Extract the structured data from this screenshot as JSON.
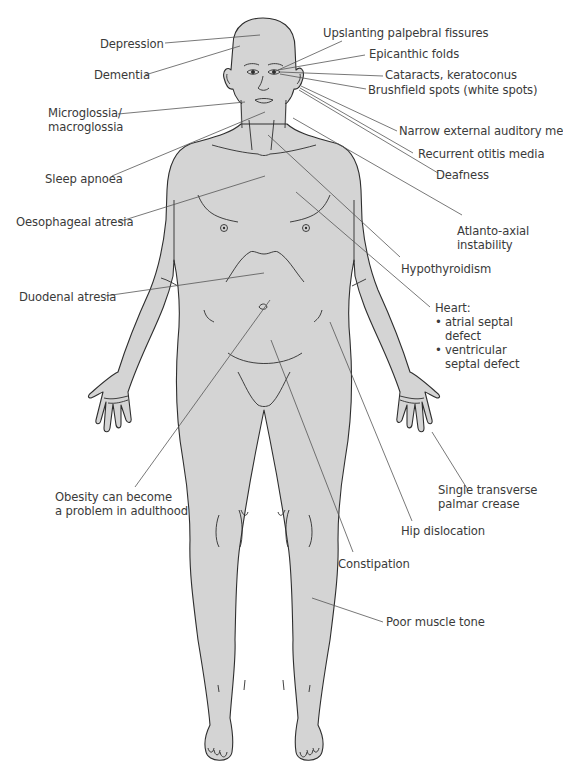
{
  "figure": {
    "body_fill": "#d4d4d4",
    "outline_color": "#2e2e2e",
    "leader_color": "#555555",
    "text_color": "#3a3a3a"
  },
  "labels": {
    "depression": "Depression",
    "dementia": "Dementia",
    "microglossia_1": "Microglossia/",
    "microglossia_2": "macroglossia",
    "sleep_apnoea": "Sleep apnoea",
    "oesophageal_atresia": "Oesophageal atresia",
    "duodenal_atresia": "Duodenal atresia",
    "obesity_1": "Obesity can become",
    "obesity_2": "a problem in adulthood",
    "upslanting": "Upslanting palpebral fissures",
    "epicanthic": "Epicanthic folds",
    "cataracts": "Cataracts, keratoconus",
    "brushfield": "Brushfield spots (white spots)",
    "narrow_meatus": "Narrow external auditory me",
    "otitis": "Recurrent otitis media",
    "deafness": "Deafness",
    "atlanto_1": "Atlanto-axial",
    "atlanto_2": "instability",
    "hypothyroidism": "Hypothyroidism",
    "heart_title": "Heart:",
    "heart_items": [
      "atrial septal defect",
      "ventricular septal defect"
    ],
    "heart_item1_l1": "atrial septal",
    "heart_item1_l2": "defect",
    "heart_item2_l1": "ventricular",
    "heart_item2_l2": "septal defect",
    "bullet": "•",
    "palmar_1": "Single transverse",
    "palmar_2": "palmar crease",
    "hip": "Hip dislocation",
    "constipation": "Constipation",
    "muscle_tone": "Poor muscle tone"
  }
}
